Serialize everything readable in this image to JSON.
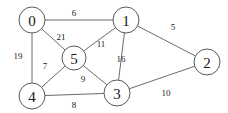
{
  "chart_data": {
    "type": "diagram",
    "title": "",
    "diagram_kind": "undirected-weighted-graph",
    "colors": {
      "background": "#ffffff",
      "edge": "#6b6b6b",
      "node_stroke": "#5a5a5a",
      "node_fill": "#ffffff",
      "text": "#1a1a1a"
    },
    "nodes": [
      {
        "id": "0",
        "label": "0",
        "x": 32,
        "y": 20,
        "r": 13
      },
      {
        "id": "1",
        "label": "1",
        "x": 126,
        "y": 20,
        "r": 13
      },
      {
        "id": "2",
        "label": "2",
        "x": 207,
        "y": 62,
        "r": 13
      },
      {
        "id": "3",
        "label": "3",
        "x": 117,
        "y": 93,
        "r": 13
      },
      {
        "id": "4",
        "label": "4",
        "x": 32,
        "y": 96,
        "r": 13
      },
      {
        "id": "5",
        "label": "5",
        "x": 74,
        "y": 58,
        "r": 12
      }
    ],
    "edges": [
      {
        "source": "0",
        "target": "1",
        "weight": "6",
        "lx": 74,
        "ly": 13
      },
      {
        "source": "0",
        "target": "5",
        "weight": "21",
        "lx": 61,
        "ly": 37
      },
      {
        "source": "0",
        "target": "4",
        "weight": "19",
        "lx": 18,
        "ly": 56
      },
      {
        "source": "1",
        "target": "2",
        "weight": "5",
        "lx": 173,
        "ly": 27
      },
      {
        "source": "1",
        "target": "5",
        "weight": "11",
        "lx": 101,
        "ly": 44
      },
      {
        "source": "1",
        "target": "3",
        "weight": "16",
        "lx": 121,
        "ly": 59
      },
      {
        "source": "4",
        "target": "5",
        "weight": "7",
        "lx": 45,
        "ly": 66
      },
      {
        "source": "5",
        "target": "3",
        "weight": "9",
        "lx": 83,
        "ly": 79
      },
      {
        "source": "4",
        "target": "3",
        "weight": "8",
        "lx": 74,
        "ly": 105
      },
      {
        "source": "3",
        "target": "2",
        "weight": "10",
        "lx": 166,
        "ly": 93
      }
    ],
    "xlabel": "",
    "ylabel": "",
    "legend": []
  }
}
